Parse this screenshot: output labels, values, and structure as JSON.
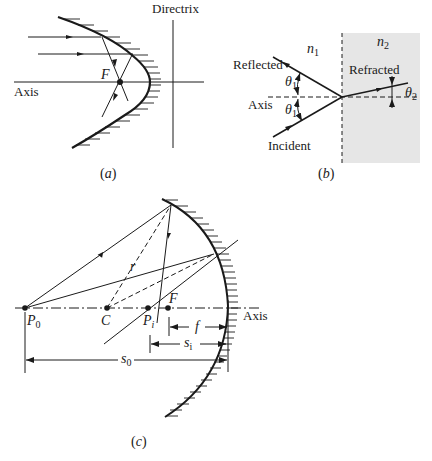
{
  "figure": {
    "panel_a": {
      "caption_open": "(",
      "caption_letter": "a",
      "caption_close": ")",
      "labels": {
        "directrix": "Directrix",
        "axis": "Axis",
        "focus": "F"
      }
    },
    "panel_b": {
      "caption_open": "(",
      "caption_letter": "b",
      "caption_close": ")",
      "labels": {
        "reflected": "Reflected",
        "incident": "Incident",
        "axis": "Axis",
        "refracted": "Refracted",
        "n1_base": "n",
        "n1_sub": "1",
        "n2_base": "n",
        "n2_sub": "2",
        "theta1_base": "θ",
        "theta1_sub": "1",
        "theta2_base": "θ",
        "theta2_sub": "2"
      },
      "colors": {
        "medium2_fill": "#e6e6e6"
      }
    },
    "panel_c": {
      "caption_open": "(",
      "caption_letter": "c",
      "caption_close": ")",
      "labels": {
        "axis": "Axis",
        "p0_base": "P",
        "p0_sub": "0",
        "c": "C",
        "pi_base": "P",
        "pi_sub": "i",
        "f_point": "F",
        "r": "r",
        "f_dist": "f",
        "si_base": "s",
        "si_sub": "i",
        "s0_base": "s",
        "s0_sub": "0"
      }
    }
  }
}
